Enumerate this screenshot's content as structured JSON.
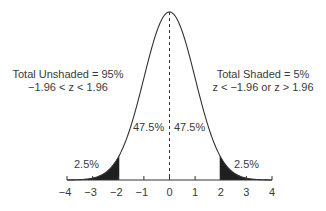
{
  "chart_data": {
    "type": "area",
    "title": "",
    "xlabel": "",
    "ylabel": "",
    "distribution": "standard normal (z)",
    "xlim": [
      -4,
      4
    ],
    "xticks": [
      -4,
      -3,
      -2,
      -1,
      0,
      1,
      2,
      3,
      4
    ],
    "xtick_labels": [
      "−4",
      "−3",
      "−2",
      "−1",
      "0",
      "1",
      "2",
      "3",
      "4"
    ],
    "critical_values": [
      -1.96,
      1.96
    ],
    "center_line": 0,
    "regions": [
      {
        "name": "left tail (shaded)",
        "range": [
          -4,
          -1.96
        ],
        "percent": 2.5,
        "shaded": true
      },
      {
        "name": "left center",
        "range": [
          -1.96,
          0
        ],
        "percent": 47.5,
        "shaded": false
      },
      {
        "name": "right center",
        "range": [
          0,
          1.96
        ],
        "percent": 47.5,
        "shaded": false
      },
      {
        "name": "right tail (shaded)",
        "range": [
          1.96,
          4
        ],
        "percent": 2.5,
        "shaded": true
      }
    ],
    "annotations": [
      {
        "text": "Total Unshaded = 95%",
        "subtext": "−1.96 < z < 1.96"
      },
      {
        "text": "Total Shaded = 5%",
        "subtext": "z < −1.96 or z > 1.96"
      },
      {
        "text": "47.5%"
      },
      {
        "text": "47.5%"
      },
      {
        "text": "2.5%"
      },
      {
        "text": "2.5%"
      }
    ],
    "grid": false,
    "legend": null
  },
  "labels": {
    "unshaded_title": "Total Unshaded = 95%",
    "unshaded_range": "−1.96 < z < 1.96",
    "shaded_title": "Total Shaded = 5%",
    "shaded_range": "z < −1.96 or z > 1.96",
    "left_center_pct": "47.5%",
    "right_center_pct": "47.5%",
    "left_tail_pct": "2.5%",
    "right_tail_pct": "2.5%"
  },
  "colors": {
    "curve": "#333333",
    "shade": "#1f1f1f",
    "text": "#3a3a3a"
  }
}
